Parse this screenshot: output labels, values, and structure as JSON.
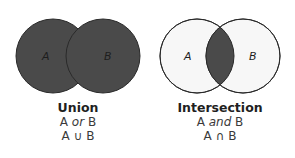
{
  "diagrams": [
    {
      "id": "union",
      "title": "Union",
      "expr_left": "A ",
      "expr_word": "or",
      "expr_right": " B",
      "notation": "A ∪ B",
      "set_labels": [
        "A",
        "B"
      ],
      "shaded_region": "A or B (entire area of both circles)"
    },
    {
      "id": "intersection",
      "title": "Intersection",
      "expr_left": "A ",
      "expr_word": "and",
      "expr_right": " B",
      "notation": "A ∩ B",
      "set_labels": [
        "A",
        "B"
      ],
      "shaded_region": "overlap of A and B only"
    }
  ],
  "colors": {
    "shade": "#4a4a4a",
    "outline": "#2a2a2a",
    "unshaded": "#f7f7f7",
    "label": "#1e1e1e"
  }
}
